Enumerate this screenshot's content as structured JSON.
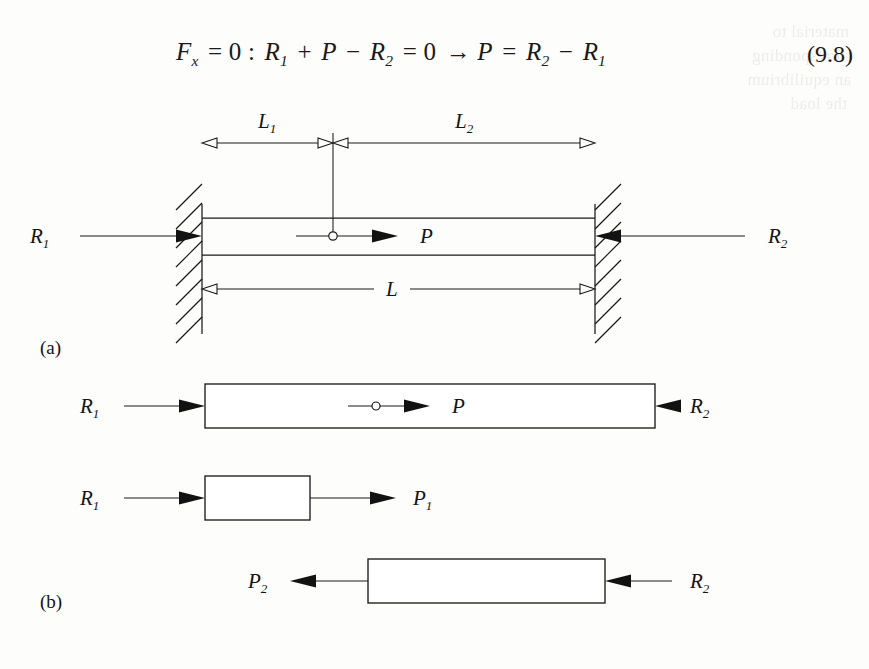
{
  "page": {
    "background_color": "#fdfdfc",
    "ink_color": "#1a1a1a",
    "width": 869,
    "height": 669
  },
  "equation": {
    "number": "(9.8)",
    "sigma_glyph": "∑",
    "parts": {
      "sum_var": "F",
      "sum_var_sub": "x",
      "eq1": " = 0 : ",
      "r1": "R",
      "r1_sub": "1",
      "plus": " + ",
      "p": "P",
      "minus": " − ",
      "r2": "R",
      "r2_sub": "2",
      "eq2": " = 0 ",
      "arrow": "→",
      "p2": " P",
      "eq3": " = ",
      "r2b": "R",
      "r2b_sub": "2",
      "minus2": " − ",
      "r1b": "R",
      "r1b_sub": "1"
    },
    "plain_text": "∑ Fx = 0 : R1 + P − R2 = 0 → P = R2 − R1"
  },
  "ghost_text": {
    "note": "faint show-through from reverse page",
    "lines": [
      {
        "text": "material to",
        "x": 20,
        "y": 22
      },
      {
        "text": "corresponding",
        "x": 16,
        "y": 46
      },
      {
        "text": "an equilibrium",
        "x": 18,
        "y": 70
      },
      {
        "text": "the load",
        "x": 22,
        "y": 94
      }
    ]
  },
  "figure": {
    "panels": [
      {
        "id": "panel-a",
        "label": "(a)",
        "label_pos": {
          "x": 40,
          "y": 268
        },
        "description": "Bar fixed between two rigid walls with an axial point load P applied at the interior section dividing it into lengths L1 and L2",
        "walls": [
          {
            "name": "left-wall",
            "x": 202,
            "y_top": 118,
            "y_bottom": 248,
            "hatch_side": "left"
          },
          {
            "name": "right-wall",
            "x": 595,
            "y_top": 118,
            "y_bottom": 248,
            "hatch_side": "right"
          }
        ],
        "bar": {
          "x1": 202,
          "x2": 595,
          "y_top": 132,
          "y_bottom": 169,
          "mid_y": 150
        },
        "load": {
          "name": "applied-load-P",
          "label": "P",
          "marker_x": 333,
          "tail_x": 296,
          "head_x": 398,
          "y": 150,
          "label_x": 420,
          "label_y": 157,
          "direction": "right",
          "head_style": "solid"
        },
        "reactions": [
          {
            "name": "reaction-R1",
            "label": "R",
            "sub": "1",
            "label_x": 30,
            "label_y": 157,
            "tail_x": 80,
            "head_x": 202,
            "y": 150,
            "direction": "right",
            "head_style": "solid"
          },
          {
            "name": "reaction-R2",
            "label": "R",
            "sub": "2",
            "label_x": 768,
            "label_y": 157,
            "tail_x": 745,
            "head_x": 595,
            "y": 150,
            "direction": "left",
            "head_style": "solid"
          }
        ],
        "dimensions": [
          {
            "name": "dimension-L1",
            "label": "L",
            "sub": "1",
            "x1": 202,
            "x2": 333,
            "y": 57,
            "label_x": 258,
            "label_y": 42,
            "head_style": "open",
            "heads": "both"
          },
          {
            "name": "dimension-L2",
            "label": "L",
            "sub": "2",
            "x1": 333,
            "x2": 595,
            "y": 57,
            "label_x": 455,
            "label_y": 42,
            "head_style": "open",
            "heads": "both"
          },
          {
            "name": "dimension-L",
            "label": "L",
            "sub": "",
            "x1": 202,
            "x2": 595,
            "y": 203,
            "label_x": 392,
            "label_y": 210,
            "head_style": "open",
            "heads": "both",
            "label_gap": 18
          }
        ],
        "extension_line": {
          "name": "section-extension-line",
          "x": 333,
          "y_top": 47,
          "y_bottom": 150
        }
      },
      {
        "id": "panel-b",
        "label": "(b)",
        "label_pos": {
          "x": 40,
          "y": 522
        },
        "description": "Three free-body diagrams: the whole bar, the left segment with internal force P1, and the right segment with internal force P2",
        "bodies": [
          {
            "name": "fbd-whole-bar",
            "bar": {
              "x1": 205,
              "x2": 655,
              "y_top": 298,
              "y_bottom": 342
            },
            "interior_load": {
              "name": "interior-load-P",
              "label": "P",
              "marker_x": 376,
              "tail_x": 348,
              "head_x": 430,
              "y": 320,
              "label_x": 452,
              "label_y": 327,
              "direction": "right",
              "head_style": "solid"
            },
            "forces": [
              {
                "name": "force-R1-left",
                "label": "R",
                "sub": "1",
                "label_x": 80,
                "label_y": 327,
                "tail_x": 124,
                "head_x": 205,
                "y": 320,
                "direction": "right",
                "head_style": "solid"
              },
              {
                "name": "force-R2-right",
                "label": "R",
                "sub": "2",
                "label_x": 690,
                "label_y": 327,
                "tail_x": 672,
                "head_x": 655,
                "y": 320,
                "direction": "left",
                "head_style": "solid",
                "tail_extend_x": 672
              }
            ]
          },
          {
            "name": "fbd-left-segment",
            "bar": {
              "x1": 205,
              "x2": 310,
              "y_top": 390,
              "y_bottom": 434
            },
            "forces": [
              {
                "name": "force-R1-left-segment",
                "label": "R",
                "sub": "1",
                "label_x": 80,
                "label_y": 419,
                "tail_x": 124,
                "head_x": 205,
                "y": 412,
                "direction": "right",
                "head_style": "solid"
              },
              {
                "name": "internal-force-P1",
                "label": "P",
                "sub": "1",
                "label_x": 413,
                "label_y": 419,
                "tail_x": 310,
                "head_x": 396,
                "y": 412,
                "direction": "right",
                "head_style": "solid"
              }
            ]
          },
          {
            "name": "fbd-right-segment",
            "bar": {
              "x1": 368,
              "x2": 605,
              "y_top": 473,
              "y_bottom": 517
            },
            "forces": [
              {
                "name": "internal-force-P2",
                "label": "P",
                "sub": "2",
                "label_x": 248,
                "label_y": 502,
                "tail_x": 368,
                "head_x": 290,
                "y": 495,
                "direction": "left",
                "head_style": "solid"
              },
              {
                "name": "force-R2-right-segment",
                "label": "R",
                "sub": "2",
                "label_x": 690,
                "label_y": 502,
                "tail_x": 672,
                "head_x": 605,
                "y": 495,
                "direction": "left",
                "head_style": "solid"
              }
            ]
          }
        ]
      }
    ]
  }
}
